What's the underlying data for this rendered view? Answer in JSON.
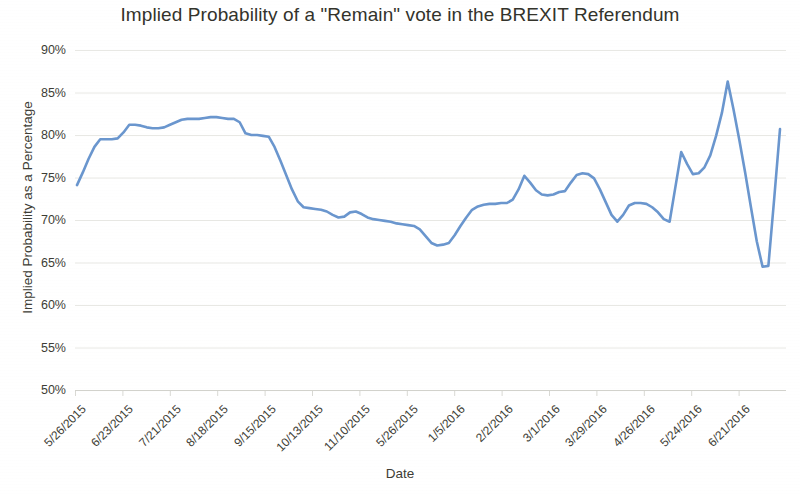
{
  "chart_data": {
    "type": "line",
    "title": "Implied Probability of a \"Remain\" vote in the BREXIT Referendum",
    "xlabel": "Date",
    "ylabel": "Implied Probability as a Percentage",
    "ylim": [
      50,
      90
    ],
    "ytick_labels": [
      "90%",
      "85%",
      "80%",
      "75%",
      "70%",
      "65%",
      "60%",
      "55%",
      "50%"
    ],
    "ytick_values": [
      90,
      85,
      80,
      75,
      70,
      65,
      60,
      55,
      50
    ],
    "xtick_labels": [
      "5/26/2015",
      "6/23/2015",
      "7/21/2015",
      "8/18/2015",
      "9/15/2015",
      "10/13/2015",
      "11/10/2015",
      "5/26/2015",
      "1/5/2016",
      "2/2/2016",
      "3/1/2016",
      "3/29/2016",
      "4/26/2016",
      "5/24/2016",
      "6/21/2016"
    ],
    "grid": "horizontal",
    "legend": "none",
    "line_color": "#6a96ce",
    "series": [
      {
        "name": "Implied Probability of Remain",
        "values": [
          74.1,
          75.6,
          77.2,
          78.6,
          79.5,
          79.5,
          79.5,
          79.6,
          80.3,
          81.2,
          81.2,
          81.1,
          80.9,
          80.8,
          80.8,
          80.9,
          81.2,
          81.5,
          81.8,
          81.9,
          81.9,
          81.9,
          82.0,
          82.1,
          82.1,
          82.0,
          81.9,
          81.9,
          81.5,
          80.2,
          80.0,
          80.0,
          79.9,
          79.8,
          78.6,
          77.0,
          75.3,
          73.6,
          72.2,
          71.5,
          71.4,
          71.3,
          71.2,
          71.0,
          70.6,
          70.3,
          70.4,
          70.9,
          71.0,
          70.7,
          70.3,
          70.1,
          70.0,
          69.9,
          69.8,
          69.6,
          69.5,
          69.4,
          69.3,
          68.9,
          68.1,
          67.3,
          67.0,
          67.1,
          67.3,
          68.2,
          69.3,
          70.3,
          71.2,
          71.6,
          71.8,
          71.9,
          71.9,
          72.0,
          72.0,
          72.4,
          73.6,
          75.2,
          74.4,
          73.5,
          73.0,
          72.9,
          73.0,
          73.3,
          73.4,
          74.4,
          75.3,
          75.5,
          75.4,
          74.9,
          73.6,
          72.1,
          70.6,
          69.8,
          70.6,
          71.7,
          72.0,
          72.0,
          71.9,
          71.5,
          70.9,
          70.1,
          69.8,
          73.9,
          78.0,
          76.6,
          75.4,
          75.5,
          76.2,
          77.6,
          79.9,
          82.6,
          86.3,
          83.0,
          79.4,
          75.6,
          71.5,
          67.5,
          64.5,
          64.6,
          72.5,
          80.7
        ]
      }
    ]
  }
}
